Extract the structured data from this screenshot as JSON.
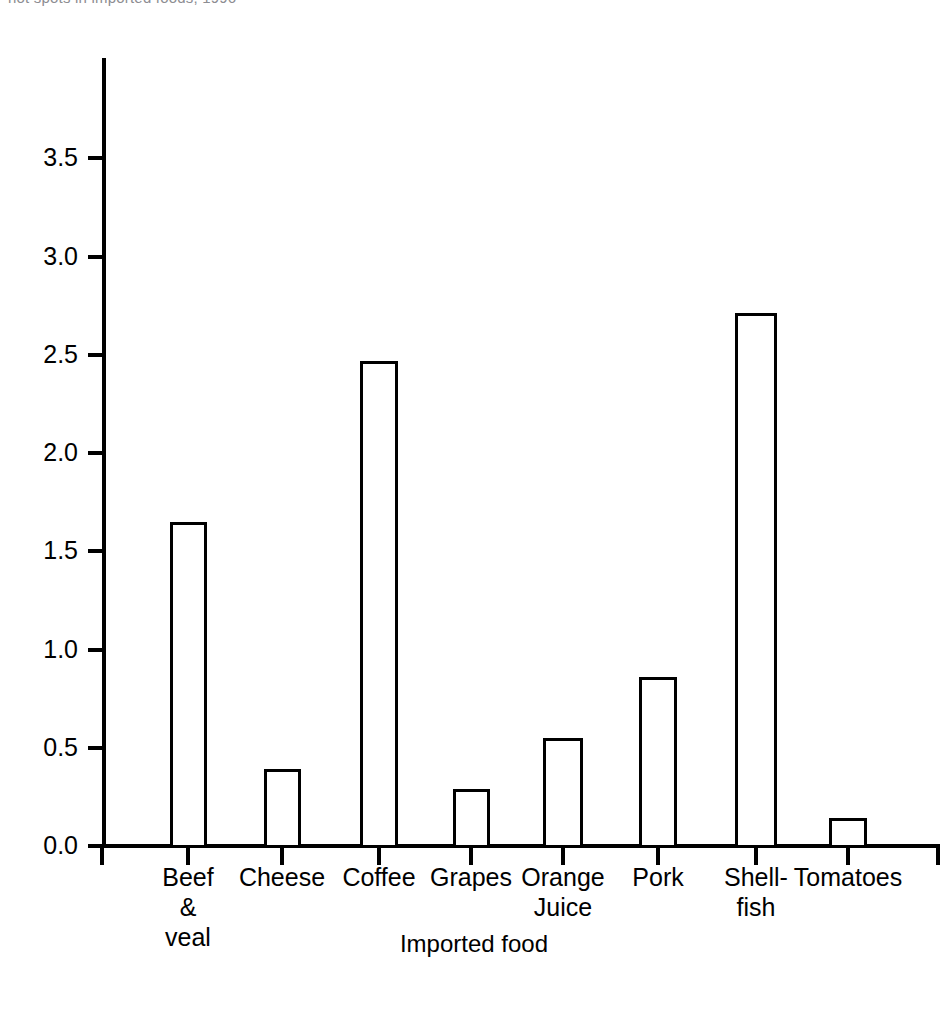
{
  "clipped_caption": "hot spots in imported foods, 1996",
  "chart_data": {
    "type": "bar",
    "title": "",
    "xlabel": "Imported food",
    "ylabel": "",
    "categories": [
      "Beef\n&\nveal",
      "Cheese",
      "Coffee",
      "Grapes",
      "Orange\nJuice",
      "Pork",
      "Shell-\nfish",
      "Tomatoes"
    ],
    "values": [
      1.65,
      0.39,
      2.47,
      0.29,
      0.55,
      0.86,
      2.71,
      0.14
    ],
    "ylim": [
      0.0,
      4.0
    ],
    "ytick_values": [
      0.0,
      0.5,
      1.0,
      1.5,
      2.0,
      2.5,
      3.0,
      3.5
    ],
    "ytick_labels": [
      "0.0",
      "0.5",
      "1.0",
      "1.5",
      "2.0",
      "2.5",
      "3.0",
      "3.5"
    ],
    "grid": false,
    "legend": false,
    "bar_fill_color": "#ffffff",
    "bar_edge_color": "#000000",
    "axis_color": "#000000"
  }
}
